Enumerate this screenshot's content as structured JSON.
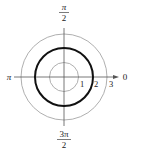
{
  "diagram": {
    "type": "polar-graph",
    "center": [
      64,
      77
    ],
    "unit_px": 14.4,
    "grid_circles": [
      1,
      2,
      3
    ],
    "curve": {
      "equation_radius": 2,
      "color": "#111111"
    },
    "grid_color": "#9a9a9a",
    "axis_color": "#555555",
    "angle_labels": {
      "top_num": "π",
      "top_den": "2",
      "left": "π",
      "right": "0",
      "bottom_num": "3π",
      "bottom_den": "2"
    },
    "radius_labels": [
      "1",
      "2",
      "3"
    ]
  }
}
